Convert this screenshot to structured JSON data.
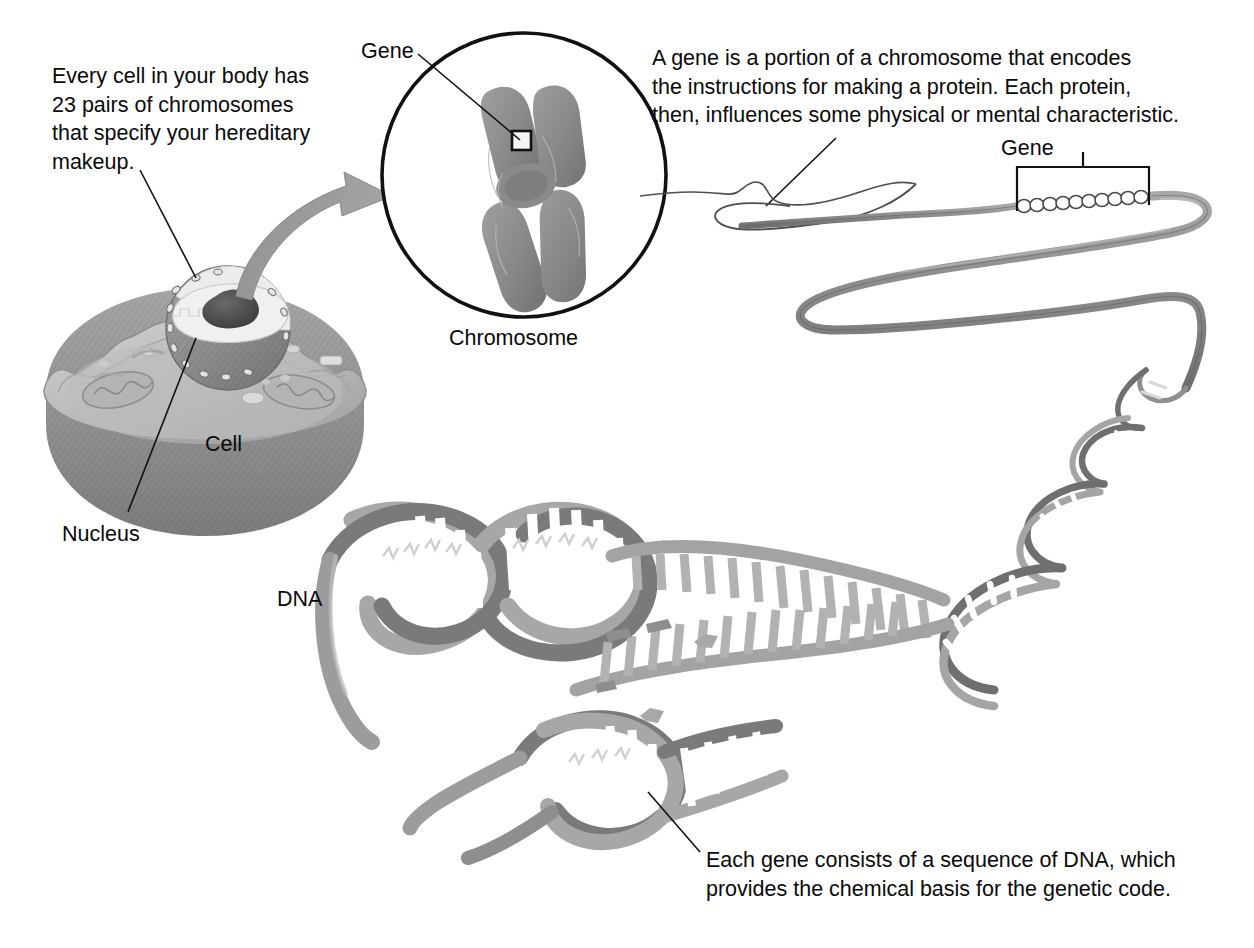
{
  "figure": {
    "background_color": "#ffffff",
    "text_color": "#0a0a0a"
  },
  "captions": {
    "intro": "Every cell in your body has\n23 pairs of chromosomes\nthat specify your hereditary\nmakeup.",
    "gene_definition": "A gene is a portion of a chromosome that encodes\nthe instructions for making a protein. Each protein,\nthen, influences some physical or mental characteristic.",
    "dna_definition": "Each gene consists of a sequence of DNA, which\nprovides the chemical basis for the genetic code."
  },
  "labels": {
    "gene_circle": "Gene",
    "gene_bracket": "Gene",
    "chromosome": "Chromosome",
    "cell": "Cell",
    "nucleus": "Nucleus",
    "dna": "DNA"
  },
  "colors": {
    "outline": "#111111",
    "cell_body": "#9a9a9a",
    "cell_body_dark": "#828282",
    "cell_cytoplasm": "#b8b8b8",
    "cell_rim": "#cdcdcd",
    "nucleus": "#8d8d8d",
    "nucleus_inner": "#e9e9e9",
    "nucleolus": "#4a4a4a",
    "mitochondria": "#b0b0b0",
    "arrow": "#9b9b9b",
    "chromosome": "#8b8b8b",
    "chromatin_ribbon": "#8e8e8e",
    "dna_backbone_front": "#7e7e7e",
    "dna_backbone_back": "#a8a8a8",
    "dna_rungs": "#ffffff"
  },
  "diagram_parts": [
    {
      "name": "cell",
      "label": "Cell",
      "description": "cut-away animal cell with wavy membrane, cytoplasm, mitochondria and nucleus"
    },
    {
      "name": "nucleus",
      "label": "Nucleus",
      "description": "spherical nucleus with nuclear pores and a dark nucleolus"
    },
    {
      "name": "magnify-arrow",
      "label": "",
      "description": "curved gray arrow from nucleus to chromosome circle"
    },
    {
      "name": "chromosome-circle",
      "label": "Chromosome",
      "description": "circular inset containing an X-shaped duplicated chromosome"
    },
    {
      "name": "gene-marker",
      "label": "Gene",
      "description": "small black square on a chromosome arm marking a gene"
    },
    {
      "name": "chromatin-fiber",
      "label": "",
      "description": "long folded gray chromatin ribbon unwinding from the chromosome"
    },
    {
      "name": "gene-bracket",
      "label": "Gene",
      "description": "bracket spanning a coiled bead segment of the fiber"
    },
    {
      "name": "dna-helix",
      "label": "DNA",
      "description": "double helix with base-pair rungs, unzipping in the middle"
    }
  ]
}
